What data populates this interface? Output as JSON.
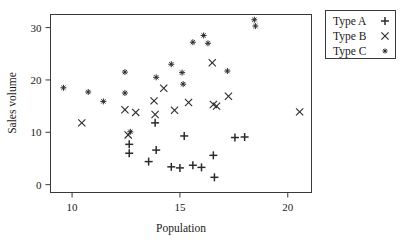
{
  "chart_data": {
    "type": "scatter",
    "title": "",
    "xlabel": "Population",
    "ylabel": "Sales volume",
    "xlim": [
      9.0,
      21.1
    ],
    "ylim": [
      -1.5,
      32.5
    ],
    "xticks": [
      10,
      15,
      20
    ],
    "yticks": [
      0,
      10,
      20,
      30
    ],
    "grid": false,
    "legend_position": "outside-top-right",
    "marker_color": "#2b2b2b",
    "series": [
      {
        "name": "Type A",
        "marker": "plus",
        "points": [
          [
            12.65,
            7.7
          ],
          [
            12.65,
            6.0
          ],
          [
            13.55,
            4.4
          ],
          [
            13.85,
            11.8
          ],
          [
            13.9,
            6.6
          ],
          [
            14.6,
            3.4
          ],
          [
            15.0,
            3.2
          ],
          [
            15.2,
            9.3
          ],
          [
            15.6,
            3.7
          ],
          [
            16.0,
            3.3
          ],
          [
            16.55,
            5.6
          ],
          [
            16.6,
            1.4
          ],
          [
            17.55,
            9.0
          ],
          [
            18.0,
            9.1
          ]
        ]
      },
      {
        "name": "Type B",
        "marker": "cross",
        "points": [
          [
            10.45,
            11.8
          ],
          [
            12.45,
            14.3
          ],
          [
            12.6,
            9.5
          ],
          [
            12.95,
            13.8
          ],
          [
            13.8,
            16.0
          ],
          [
            13.85,
            13.4
          ],
          [
            14.25,
            18.4
          ],
          [
            14.75,
            14.2
          ],
          [
            15.4,
            15.7
          ],
          [
            16.55,
            15.3
          ],
          [
            16.7,
            15.0
          ],
          [
            16.5,
            23.3
          ],
          [
            17.25,
            16.9
          ],
          [
            20.55,
            13.9
          ]
        ]
      },
      {
        "name": "Type C",
        "marker": "star",
        "points": [
          [
            9.6,
            18.5
          ],
          [
            10.75,
            17.7
          ],
          [
            11.45,
            15.9
          ],
          [
            12.45,
            21.5
          ],
          [
            12.45,
            17.5
          ],
          [
            12.7,
            10.1
          ],
          [
            13.9,
            20.5
          ],
          [
            14.6,
            23.0
          ],
          [
            15.1,
            21.4
          ],
          [
            15.15,
            19.2
          ],
          [
            15.6,
            27.2
          ],
          [
            16.1,
            28.5
          ],
          [
            16.3,
            27.0
          ],
          [
            17.2,
            21.7
          ],
          [
            18.45,
            31.5
          ],
          [
            18.5,
            30.3
          ]
        ]
      }
    ]
  },
  "axes": {
    "xlabel": "Population",
    "ylabel": "Sales volume",
    "xtick_labels": [
      "10",
      "15",
      "20"
    ],
    "ytick_labels": [
      "0",
      "10",
      "20",
      "30"
    ]
  },
  "legend": {
    "entries": [
      {
        "label": "Type A",
        "marker": "plus"
      },
      {
        "label": "Type B",
        "marker": "cross"
      },
      {
        "label": "Type C",
        "marker": "star"
      }
    ]
  }
}
